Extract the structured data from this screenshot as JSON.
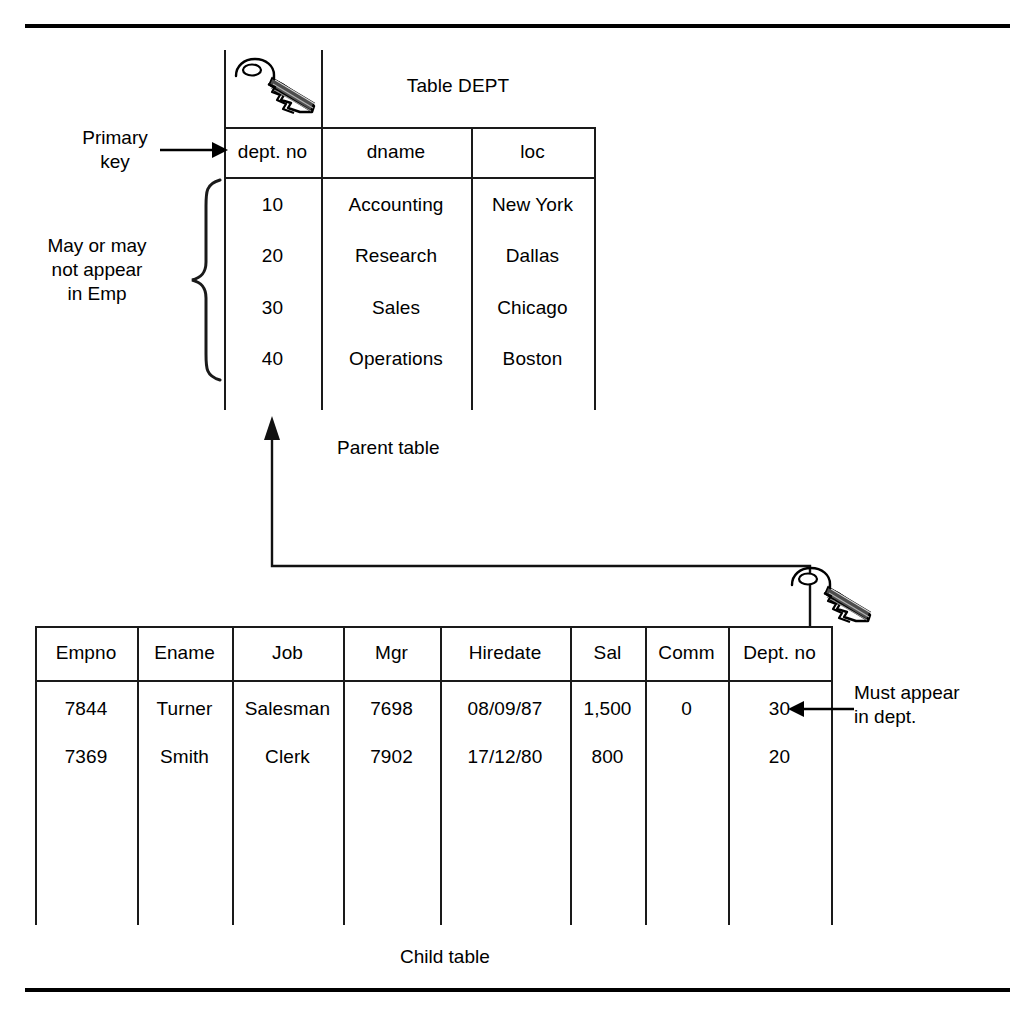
{
  "figure": {
    "title_dept": "Table DEPT",
    "caption_parent": "Parent table",
    "caption_child": "Child table"
  },
  "annotations": {
    "primary_key": "Primary\nkey",
    "may_or_may_not": "May or may\nnot appear\nin Emp",
    "must_appear": "Must appear\nin dept."
  },
  "icons": {
    "dept_key": "key-icon",
    "emp_foreign_key": "key-icon"
  },
  "dept_table": {
    "name": "DEPT",
    "columns": [
      "dept. no",
      "dname",
      "loc"
    ],
    "rows": [
      [
        "10",
        "Accounting",
        "New York"
      ],
      [
        "20",
        "Research",
        "Dallas"
      ],
      [
        "30",
        "Sales",
        "Chicago"
      ],
      [
        "40",
        "Operations",
        "Boston"
      ]
    ]
  },
  "emp_table": {
    "name": "EMP",
    "columns": [
      "Empno",
      "Ename",
      "Job",
      "Mgr",
      "Hiredate",
      "Sal",
      "Comm",
      "Dept. no"
    ],
    "rows": [
      [
        "7844",
        "Turner",
        "Salesman",
        "7698",
        "08/09/87",
        "1,500",
        "0",
        "30"
      ],
      [
        "7369",
        "Smith",
        "Clerk",
        "7902",
        "17/12/80",
        "800",
        "",
        "20"
      ]
    ]
  },
  "colors": {
    "ink": "#000000",
    "line": "#1a1a1a",
    "page": "#ffffff"
  }
}
